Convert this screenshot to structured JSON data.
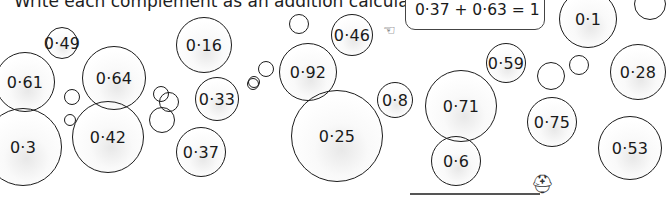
{
  "instruction": "Write each complement as an addition calculation.",
  "example": {
    "text": "0·37 + 0·63 = 1"
  },
  "bubbles": [
    {
      "label": "0·49",
      "cx": 62,
      "cy": 43,
      "r": 16
    },
    {
      "label": "0·16",
      "cx": 204,
      "cy": 45,
      "r": 28
    },
    {
      "label": "0·61",
      "cx": 25,
      "cy": 82,
      "r": 30
    },
    {
      "label": "0·64",
      "cx": 114,
      "cy": 78,
      "r": 32
    },
    {
      "label": "0·33",
      "cx": 217,
      "cy": 99,
      "r": 22
    },
    {
      "label": "0·3",
      "cx": 23,
      "cy": 147,
      "r": 39
    },
    {
      "label": "0·42",
      "cx": 108,
      "cy": 137,
      "r": 36
    },
    {
      "label": "0·37",
      "cx": 201,
      "cy": 152,
      "r": 25
    },
    {
      "label": "0·46",
      "cx": 352,
      "cy": 35,
      "r": 21
    },
    {
      "label": "0·92",
      "cx": 308,
      "cy": 72,
      "r": 29
    },
    {
      "label": "0·25",
      "cx": 337,
      "cy": 136,
      "r": 46
    },
    {
      "label": "0·8",
      "cx": 395,
      "cy": 100,
      "r": 18
    },
    {
      "label": "0·1",
      "cx": 588,
      "cy": 19,
      "r": 29
    },
    {
      "label": "0·59",
      "cx": 506,
      "cy": 63,
      "r": 20
    },
    {
      "label": "0·71",
      "cx": 461,
      "cy": 106,
      "r": 36
    },
    {
      "label": "0·6",
      "cx": 456,
      "cy": 161,
      "r": 25
    },
    {
      "label": "0·75",
      "cx": 552,
      "cy": 122,
      "r": 25
    },
    {
      "label": "0·28",
      "cx": 638,
      "cy": 72,
      "r": 28
    },
    {
      "label": "0·53",
      "cx": 630,
      "cy": 148,
      "r": 32
    }
  ],
  "empty_bubbles": [
    {
      "cx": 650,
      "cy": 4,
      "r": 16
    },
    {
      "cx": 299,
      "cy": 24,
      "r": 10
    },
    {
      "cx": 266,
      "cy": 69,
      "r": 8
    },
    {
      "cx": 254,
      "cy": 82,
      "r": 6
    },
    {
      "cx": 72,
      "cy": 97,
      "r": 8
    },
    {
      "cx": 70,
      "cy": 120,
      "r": 6
    },
    {
      "cx": 161,
      "cy": 94,
      "r": 8
    },
    {
      "cx": 169,
      "cy": 102,
      "r": 10
    },
    {
      "cx": 162,
      "cy": 120,
      "r": 13
    },
    {
      "cx": 253,
      "cy": 84,
      "r": 6
    },
    {
      "cx": 551,
      "cy": 76,
      "r": 14
    },
    {
      "cx": 579,
      "cy": 65,
      "r": 10
    }
  ]
}
